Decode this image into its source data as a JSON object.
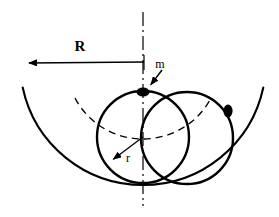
{
  "figure": {
    "type": "physics-diagram",
    "width": 279,
    "height": 217,
    "background_color": "#ffffff",
    "stroke_color": "#000000"
  },
  "labels": {
    "bowl_radius": "R",
    "point_mass": "m",
    "circle_radius": "r"
  },
  "geometry": {
    "bowl": {
      "name": "bowl-arc",
      "center_x": 143,
      "center_y": 62,
      "radius": 123,
      "start_angle_deg": 168,
      "end_angle_deg": 12,
      "style": "solid"
    },
    "dashed_locus": {
      "name": "center-locus-arc",
      "center_x": 143,
      "center_y": 62,
      "radius": 77,
      "start_angle_deg": 152,
      "end_angle_deg": 28,
      "style": "dashed"
    },
    "axis": {
      "name": "vertical-axis",
      "x": 143,
      "y_top": 12,
      "y_bottom": 206,
      "style": "dash-dot"
    },
    "circles": [
      {
        "name": "rolling-circle-left",
        "center_x": 143,
        "center_y": 137,
        "radius": 46,
        "style": "solid"
      },
      {
        "name": "rolling-circle-right",
        "center_x": 187,
        "center_y": 138,
        "radius": 46,
        "style": "solid"
      }
    ],
    "mass_points": [
      {
        "name": "mass-dot-top",
        "x": 143,
        "y": 92,
        "radius": 5
      },
      {
        "name": "mass-dot-right",
        "x": 228,
        "y": 111,
        "radius": 5
      }
    ],
    "dimension_arrows": [
      {
        "name": "R-dimension-arrow",
        "from_x": 144,
        "from_y": 62,
        "to_x": 21,
        "to_y": 63,
        "label": "R",
        "label_x": 80,
        "label_y": 51
      },
      {
        "name": "r-dimension-arrow",
        "from_x": 143,
        "from_y": 137,
        "to_x": 107,
        "to_y": 164,
        "label": "r",
        "label_x": 128,
        "label_y": 162
      },
      {
        "name": "m-pointer-arrow",
        "from_x": 162,
        "from_y": 70,
        "to_x": 146,
        "to_y": 91,
        "label": "m",
        "label_x": 160,
        "label_y": 68
      }
    ]
  }
}
